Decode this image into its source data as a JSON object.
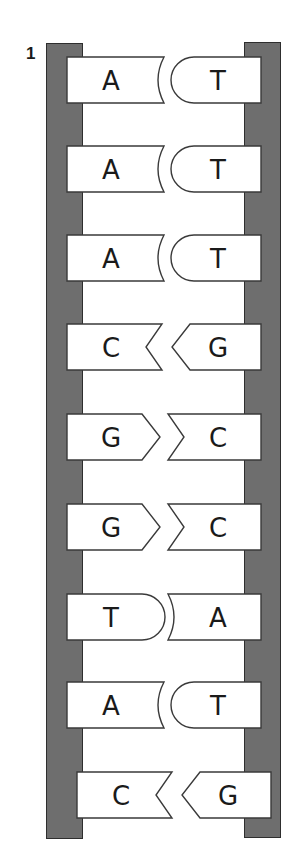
{
  "diagram": {
    "label": "1",
    "colors": {
      "backbone": "#6e6e6e",
      "backbone_outline": "#2e2e2e",
      "base_fill": "#ffffff",
      "base_outline": "#3a3a3a",
      "text": "#1a1a1a"
    },
    "pairs": [
      {
        "left": "A",
        "right": "T"
      },
      {
        "left": "A",
        "right": "T"
      },
      {
        "left": "A",
        "right": "T"
      },
      {
        "left": "C",
        "right": "G"
      },
      {
        "left": "G",
        "right": "C"
      },
      {
        "left": "G",
        "right": "C"
      },
      {
        "left": "T",
        "right": "A"
      },
      {
        "left": "A",
        "right": "T"
      },
      {
        "left": "C",
        "right": "G"
      }
    ]
  }
}
